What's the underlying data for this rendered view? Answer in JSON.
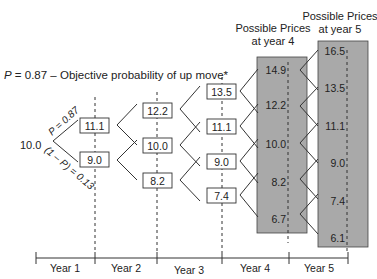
{
  "title": "P = 0.87 – Objective probability of up move*",
  "title_parts": {
    "p": "P",
    "rest": " = 0.87 – Objective probability of up move*"
  },
  "start_value": "10.0",
  "branch_labels": {
    "up": "P = 0.87",
    "down": "(1 – P) = 0.13"
  },
  "headers": {
    "year4": [
      "Possible Prices",
      "at year 4"
    ],
    "year5": [
      "Possible Prices",
      "at year 5"
    ]
  },
  "nodes": {
    "year1": [
      "11.1",
      "9.0"
    ],
    "year2": [
      "12.2",
      "10.0",
      "8.2"
    ],
    "year3": [
      "13.5",
      "11.1",
      "9.0",
      "7.4"
    ],
    "year4": [
      "14.9",
      "12.2",
      "10.0",
      "8.2",
      "6.7"
    ],
    "year5": [
      "16.5",
      "13.5",
      "11.1",
      "9.0",
      "7.4",
      "6.1"
    ]
  },
  "axis": {
    "labels": [
      "Year 1",
      "Year 2",
      "Year 3",
      "Year 4",
      "Year 5"
    ]
  },
  "colors": {
    "shade": "#a9a9a9",
    "line": "#333333"
  }
}
